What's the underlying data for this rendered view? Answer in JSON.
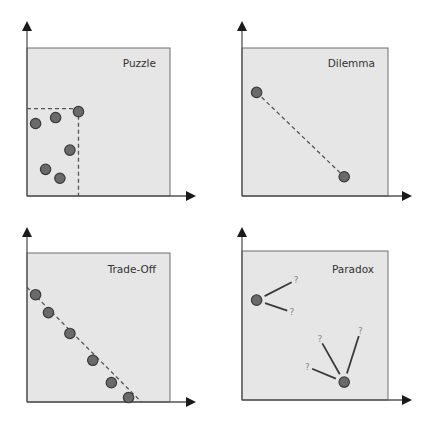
{
  "panels": [
    {
      "id": "puzzle",
      "title": "Puzzle",
      "points": [
        [
          0.36,
          0.57
        ],
        [
          0.2,
          0.53
        ],
        [
          0.06,
          0.49
        ],
        [
          0.3,
          0.31
        ],
        [
          0.13,
          0.18
        ],
        [
          0.23,
          0.12
        ]
      ],
      "frontier_corner": [
        0.36,
        0.59
      ]
    },
    {
      "id": "dilemma",
      "title": "Dilemma",
      "points": [
        [
          0.1,
          0.7
        ],
        [
          0.7,
          0.13
        ]
      ]
    },
    {
      "id": "trade-off",
      "title": "Trade-Off",
      "points": [
        [
          0.06,
          0.72
        ],
        [
          0.15,
          0.6
        ],
        [
          0.3,
          0.46
        ],
        [
          0.46,
          0.28
        ],
        [
          0.59,
          0.13
        ],
        [
          0.71,
          0.03
        ]
      ],
      "trend_line": [
        [
          0.0,
          0.77
        ],
        [
          0.8,
          0.0
        ]
      ]
    },
    {
      "id": "paradox",
      "title": "Paradox",
      "points": [
        [
          0.1,
          0.67
        ],
        [
          0.7,
          0.12
        ]
      ],
      "question_mark": "?",
      "branches": [
        {
          "from": 0,
          "to": [
            0.34,
            0.79
          ]
        },
        {
          "from": 0,
          "to": [
            0.31,
            0.6
          ]
        },
        {
          "from": 1,
          "to": [
            0.55,
            0.38
          ]
        },
        {
          "from": 1,
          "to": [
            0.8,
            0.43
          ]
        },
        {
          "from": 1,
          "to": [
            0.48,
            0.21
          ]
        }
      ]
    }
  ]
}
